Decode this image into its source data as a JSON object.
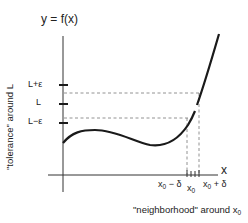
{
  "diagram": {
    "function_label": "y = f(x)",
    "x_axis_label": "x",
    "y_axis_ticks": [
      {
        "label": "L+ε",
        "role": "upper-tolerance"
      },
      {
        "label": "L",
        "role": "limit"
      },
      {
        "label": "L−ε",
        "role": "lower-tolerance"
      }
    ],
    "x_axis_ticks": [
      {
        "label_base": "x",
        "label_sub": "0",
        "label_suffix": " − δ",
        "role": "left-neighborhood"
      },
      {
        "label_base": "x",
        "label_sub": "0",
        "label_suffix": "",
        "role": "center"
      },
      {
        "label_base": "x",
        "label_sub": "0",
        "label_suffix": " + δ",
        "role": "right-neighborhood"
      }
    ],
    "tolerance_label": "\"tolerance\" around L",
    "neighborhood_label_prefix": "\"neighborhood\" around x",
    "neighborhood_label_sub": "0",
    "colors": {
      "curve": "#1a1a1a",
      "axes": "#333333",
      "dashed": "#777777",
      "text": "#222222"
    }
  }
}
